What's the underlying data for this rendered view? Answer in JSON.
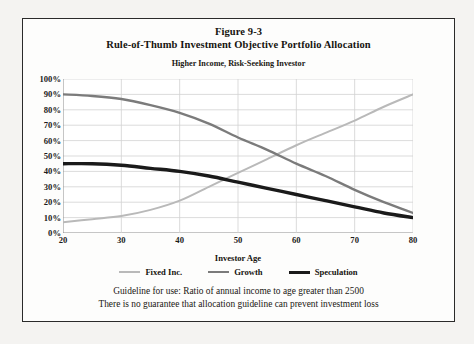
{
  "figure": {
    "title_line1": "Figure 9-3",
    "title_line2": "Rule-of-Thumb Investment Objective Portfolio Allocation",
    "subtitle": "Higher Income, Risk-Seeking Investor"
  },
  "footer": {
    "line1": "Guideline for use: Ratio of annual income to age greater than 2500",
    "line2": "There is no guarantee that allocation guideline can prevent investment loss"
  },
  "colors": {
    "fixed_inc": "#b9b9b9",
    "growth": "#7b7b7b",
    "speculation": "#1a1a1a",
    "grid": "#d2d2d2",
    "axis": "#8c8c8c",
    "frame": "#2a2a2a",
    "page": "#f4f3f1",
    "plot_bg": "#ffffff"
  },
  "chart_data": {
    "type": "line",
    "title": "Rule-of-Thumb Investment Objective Portfolio Allocation",
    "subtitle": "Higher Income, Risk-Seeking Investor",
    "xlabel": "Investor Age",
    "ylabel": "",
    "xlim": [
      20,
      80
    ],
    "ylim": [
      0,
      100
    ],
    "grid": true,
    "legend_position": "bottom",
    "xticks": [
      20,
      30,
      40,
      50,
      60,
      70,
      80
    ],
    "xtick_labels": [
      "20",
      "30",
      "40",
      "50",
      "60",
      "70",
      "80"
    ],
    "yticks": [
      0,
      10,
      20,
      30,
      40,
      50,
      60,
      70,
      80,
      90,
      100
    ],
    "ytick_labels": [
      "0%",
      "10%",
      "20%",
      "30%",
      "40%",
      "50%",
      "60%",
      "70%",
      "80%",
      "90%",
      "100%"
    ],
    "x": [
      20,
      25,
      30,
      35,
      40,
      45,
      50,
      55,
      60,
      65,
      70,
      75,
      80
    ],
    "series": [
      {
        "name": "Fixed Inc.",
        "color": "#b9b9b9",
        "width": 2.0,
        "values": [
          7,
          9,
          11,
          15,
          21,
          30,
          39,
          48,
          57,
          65,
          73,
          82,
          90
        ]
      },
      {
        "name": "Growth",
        "color": "#7b7b7b",
        "width": 2.4,
        "values": [
          90,
          89,
          87,
          83,
          78,
          71,
          62,
          54,
          45,
          37,
          28,
          20,
          13
        ]
      },
      {
        "name": "Speculation",
        "color": "#1a1a1a",
        "width": 3.4,
        "values": [
          45,
          45,
          44,
          42,
          40,
          37,
          33,
          29,
          25,
          21,
          17,
          13,
          10
        ]
      }
    ],
    "annotations": [
      {
        "text": "Fixed Inc. crosses Speculation",
        "x": 46,
        "y": 35
      },
      {
        "text": "Fixed Inc. crosses Growth",
        "x": 57,
        "y": 51
      }
    ]
  }
}
